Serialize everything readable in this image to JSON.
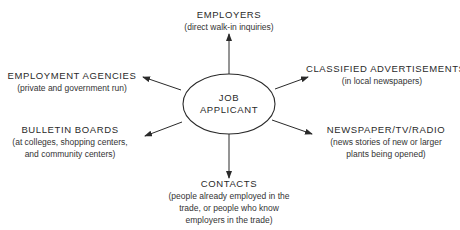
{
  "center": {
    "line1": "JOB",
    "line2": "APPLICANT"
  },
  "nodes": {
    "employers": {
      "title": "EMPLOYERS",
      "sub": [
        "(direct walk-in inquiries)"
      ]
    },
    "employment_agencies": {
      "title": "EMPLOYMENT AGENCIES",
      "sub": [
        "(private and government run)"
      ]
    },
    "classified_ads": {
      "title": "CLASSIFIED ADVERTISEMENTS",
      "sub": [
        "(in local newspapers)"
      ]
    },
    "bulletin_boards": {
      "title": "BULLETIN BOARDS",
      "sub": [
        "(at colleges, shopping centers,",
        "and community centers)"
      ]
    },
    "newspaper_tv_radio": {
      "title": "NEWSPAPER/TV/RADIO",
      "sub": [
        "(news stories of new or larger",
        "plants being opened)"
      ]
    },
    "contacts": {
      "title": "CONTACTS",
      "sub": [
        "(people already employed in the",
        "trade, or people who know",
        "employers in the trade)"
      ]
    }
  },
  "colors": {
    "line": "#2a2a2a",
    "text": "#2a2a2a",
    "background": "#ffffff"
  }
}
